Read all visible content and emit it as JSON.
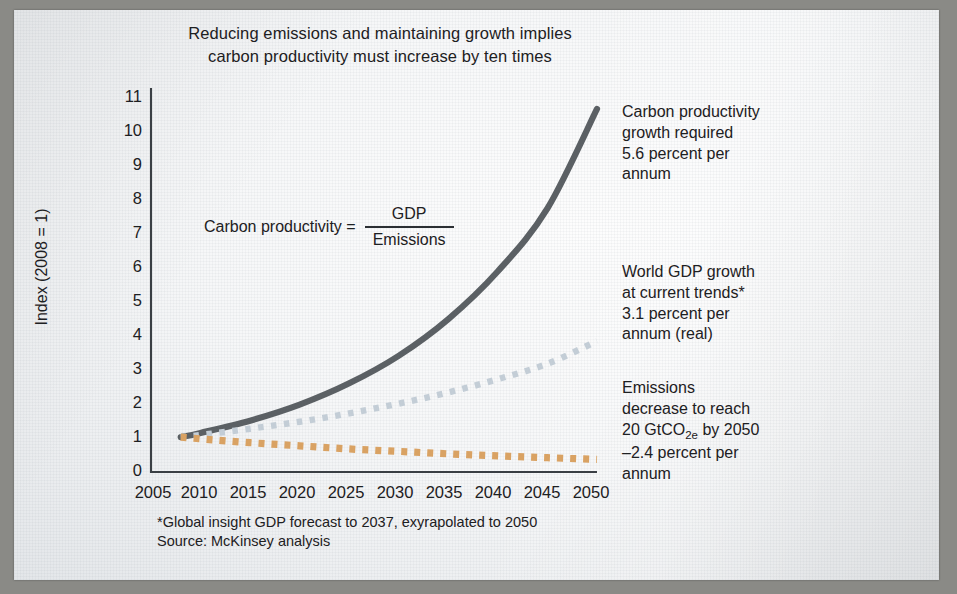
{
  "title": {
    "line1": "Reducing emissions and maintaining growth implies",
    "line2": "carbon productivity must increase by ten times"
  },
  "axes": {
    "ylabel": "Index (2008 = 1)",
    "yticks": [
      "0",
      "1",
      "2",
      "3",
      "4",
      "5",
      "6",
      "7",
      "8",
      "9",
      "10",
      "11"
    ],
    "xticks": [
      "2005",
      "2010",
      "2015",
      "2020",
      "2025",
      "2030",
      "2035",
      "2040",
      "2045",
      "2050"
    ]
  },
  "formula": {
    "lhs": "Carbon productivity  =",
    "numerator": "GDP",
    "denominator": "Emissions"
  },
  "annotations": {
    "carbon_productivity": {
      "l1": "Carbon productivity",
      "l2": "growth required",
      "l3": "5.6 percent per",
      "l4": "annum"
    },
    "gdp": {
      "l1": "World GDP growth",
      "l2": "at current trends*",
      "l3": "3.1 percent per",
      "l4": "annum (real)"
    },
    "emissions": {
      "l1": "Emissions",
      "l2": "decrease to reach",
      "l3a": "20 GtCO",
      "l3b": "2e",
      "l3c": " by 2050",
      "l4": "–2.4 percent per",
      "l5": "annum"
    }
  },
  "footnote": {
    "line1": "*Global insight GDP forecast to 2037, exyrapolated to 2050",
    "line2": "Source: McKinsey analysis"
  },
  "colors": {
    "carbon_productivity": "#5b6064",
    "gdp": "#c3cdd6",
    "emissions": "#d9a263",
    "axis": "#3a3f44",
    "text": "#1d2022"
  },
  "chart_data": {
    "type": "line",
    "title": "Reducing emissions and maintaining growth implies carbon productivity must increase by ten times",
    "xlabel": "",
    "ylabel": "Index (2008 = 1)",
    "xlim": [
      2005,
      2050
    ],
    "ylim": [
      0,
      11
    ],
    "grid": false,
    "legend": "annotations at right",
    "x": [
      2008,
      2010,
      2015,
      2020,
      2025,
      2030,
      2035,
      2040,
      2045,
      2050
    ],
    "series": [
      {
        "name": "Carbon productivity growth required (5.6% per annum)",
        "style": "solid",
        "color": "#5b6064",
        "annotation": "Carbon productivity growth required 5.6 percent per annum",
        "values": [
          1.0,
          1.12,
          1.47,
          1.93,
          2.54,
          3.33,
          4.38,
          5.75,
          7.55,
          10.4
        ]
      },
      {
        "name": "World GDP growth at current trends (3.1% per annum, real)",
        "style": "dotted",
        "color": "#c3cdd6",
        "annotation": "World GDP growth at current trends* 3.1 percent per annum (real)",
        "values": [
          1.0,
          1.06,
          1.24,
          1.44,
          1.68,
          1.96,
          2.28,
          2.66,
          3.1,
          3.75
        ]
      },
      {
        "name": "Emissions decrease to reach 20 GtCO2e by 2050 (-2.4% per annum)",
        "style": "dotted",
        "color": "#d9a263",
        "annotation": "Emissions decrease to reach 20 GtCO2e by 2050 –2.4 percent per annum",
        "values": [
          1.0,
          0.95,
          0.84,
          0.75,
          0.66,
          0.59,
          0.52,
          0.46,
          0.41,
          0.36
        ]
      }
    ]
  }
}
